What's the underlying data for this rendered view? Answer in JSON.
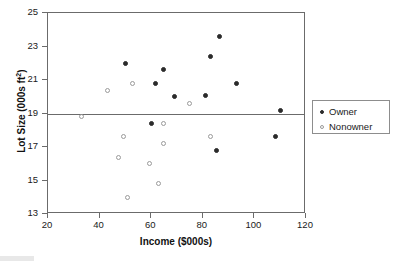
{
  "chart_data": {
    "type": "scatter",
    "title": "",
    "xlabel": "Income ($000s)",
    "ylabel": "Lot Size (000s ft",
    "ylabel_sup": "2",
    "ylabel_suffix": ")",
    "xlim": [
      20,
      120
    ],
    "ylim": [
      13,
      25
    ],
    "xticks": [
      20,
      40,
      60,
      80,
      100,
      120
    ],
    "yticks": [
      13,
      15,
      17,
      19,
      21,
      23,
      25
    ],
    "grid": false,
    "reference_lines": [
      {
        "axis": "y",
        "value": 19,
        "color": "#6b6b6b"
      }
    ],
    "legend_position": "right",
    "series": [
      {
        "name": "Owner",
        "marker": "filled-circle",
        "color": "#2b2b2b",
        "points": [
          {
            "x": 50.0,
            "y": 22.0
          },
          {
            "x": 61.5,
            "y": 20.8
          },
          {
            "x": 64.8,
            "y": 21.6
          },
          {
            "x": 69.0,
            "y": 20.0
          },
          {
            "x": 81.0,
            "y": 20.1
          },
          {
            "x": 83.0,
            "y": 22.4
          },
          {
            "x": 86.5,
            "y": 23.6
          },
          {
            "x": 93.0,
            "y": 20.8
          },
          {
            "x": 110.0,
            "y": 19.2
          },
          {
            "x": 60.0,
            "y": 18.4
          },
          {
            "x": 85.5,
            "y": 16.8
          },
          {
            "x": 108.0,
            "y": 17.6
          }
        ]
      },
      {
        "name": "Nonowner",
        "marker": "open-circle",
        "color": "#9a9a9a",
        "points": [
          {
            "x": 43.2,
            "y": 20.4
          },
          {
            "x": 52.8,
            "y": 20.8
          },
          {
            "x": 33.0,
            "y": 18.8
          },
          {
            "x": 64.8,
            "y": 18.4
          },
          {
            "x": 75.0,
            "y": 19.6
          },
          {
            "x": 49.2,
            "y": 17.6
          },
          {
            "x": 64.8,
            "y": 17.2
          },
          {
            "x": 83.0,
            "y": 17.6
          },
          {
            "x": 47.4,
            "y": 16.4
          },
          {
            "x": 59.4,
            "y": 16.0
          },
          {
            "x": 63.0,
            "y": 14.8
          },
          {
            "x": 51.0,
            "y": 14.0
          }
        ]
      }
    ]
  },
  "legend": {
    "items": [
      {
        "label": "Owner",
        "marker": "filled-circle"
      },
      {
        "label": "Nonowner",
        "marker": "open-circle"
      }
    ]
  }
}
